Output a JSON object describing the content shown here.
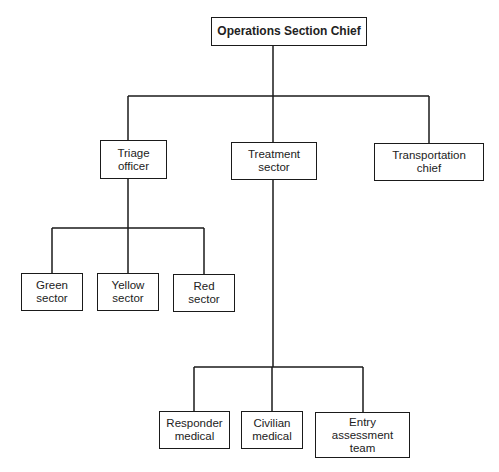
{
  "diagram": {
    "type": "org-chart",
    "nodes": {
      "root": {
        "label": "Operations Section Chief"
      },
      "triage": {
        "label": "Triage\nofficer"
      },
      "treatment": {
        "label": "Treatment\nsector"
      },
      "transport": {
        "label": "Transportation\nchief"
      },
      "green": {
        "label": "Green\nsector"
      },
      "yellow": {
        "label": "Yellow\nsector"
      },
      "red": {
        "label": "Red\nsector"
      },
      "responder": {
        "label": "Responder\nmedical"
      },
      "civilian": {
        "label": "Civilian\nmedical"
      },
      "entry": {
        "label": "Entry\nassessment\nteam"
      }
    },
    "edges": [
      [
        "Operations Section Chief",
        "Triage officer"
      ],
      [
        "Operations Section Chief",
        "Treatment sector"
      ],
      [
        "Operations Section Chief",
        "Transportation chief"
      ],
      [
        "Triage officer",
        "Green sector"
      ],
      [
        "Triage officer",
        "Yellow sector"
      ],
      [
        "Triage officer",
        "Red sector"
      ],
      [
        "Treatment sector",
        "Responder medical"
      ],
      [
        "Treatment sector",
        "Civilian medical"
      ],
      [
        "Treatment sector",
        "Entry assessment team"
      ]
    ],
    "colors": {
      "line": "#1a1a1a",
      "background": "#ffffff"
    }
  }
}
